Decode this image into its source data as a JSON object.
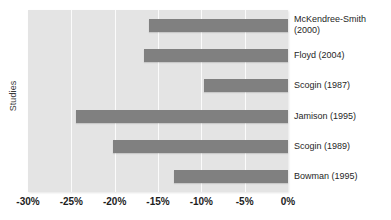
{
  "chart_data": {
    "type": "bar",
    "orientation": "horizontal",
    "title": "",
    "xlabel": "",
    "ylabel": "Studies",
    "categories": [
      "McKendree-Smith (2000)",
      "Floyd (2004)",
      "Scogin (1987)",
      "Jamison (1995)",
      "Scogin (1989)",
      "Bowman (1995)"
    ],
    "category_lines": [
      [
        "McKendree-Smith",
        "(2000)"
      ],
      [
        "Floyd (2004)",
        ""
      ],
      [
        "Scogin (1987)",
        ""
      ],
      [
        "Jamison (1995)",
        ""
      ],
      [
        "Scogin (1989)",
        ""
      ],
      [
        "Bowman (1995)",
        ""
      ]
    ],
    "values": [
      -16.0,
      -16.6,
      -9.7,
      -24.5,
      -20.2,
      -13.2
    ],
    "value_unit": "%",
    "xlim": [
      -30,
      0
    ],
    "xticks": [
      -30,
      -25,
      -20,
      -15,
      -10,
      -5,
      0
    ],
    "xtick_labels": [
      "-30%",
      "-25%",
      "-20%",
      "-15%",
      "-10%",
      "-5%",
      "0%"
    ],
    "grid": true,
    "grid_axis": "x",
    "legend": false,
    "colors": {
      "bar": "#808080",
      "plot_background": "#e4e4e4",
      "gridline": "#fbfbfb",
      "text": "#262626"
    }
  }
}
